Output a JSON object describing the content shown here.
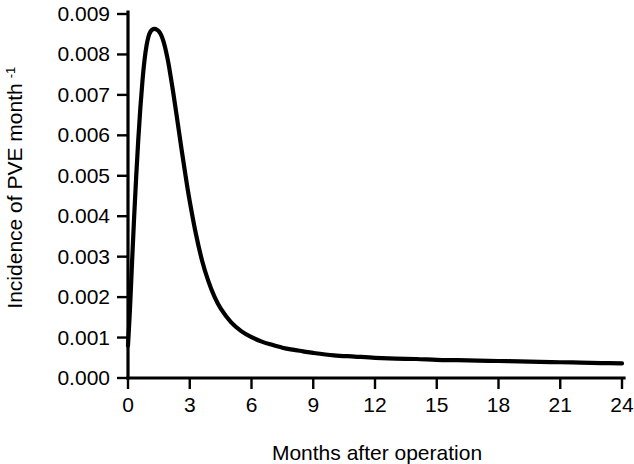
{
  "chart_data": {
    "type": "line",
    "title": "",
    "xlabel": "Months after operation",
    "ylabel": "Incidence of PVE month",
    "ylabel_superscript": "-1",
    "xlim": [
      0,
      24
    ],
    "ylim": [
      0,
      0.009
    ],
    "grid": false,
    "legend": "none",
    "x_ticks": [
      "0",
      "3",
      "6",
      "9",
      "12",
      "15",
      "18",
      "21",
      "24"
    ],
    "x_tick_values": [
      0,
      3,
      6,
      9,
      12,
      15,
      18,
      21,
      24
    ],
    "y_ticks": [
      "0.000",
      "0.001",
      "0.002",
      "0.003",
      "0.004",
      "0.005",
      "0.006",
      "0.007",
      "0.008",
      "0.009"
    ],
    "y_tick_values": [
      0.0,
      0.001,
      0.002,
      0.003,
      0.004,
      0.005,
      0.006,
      0.007,
      0.008,
      0.009
    ],
    "series": [
      {
        "name": "Incidence of PVE",
        "color": "#000000",
        "x": [
          0.0,
          0.1,
          0.2,
          0.3,
          0.4,
          0.5,
          0.6,
          0.7,
          0.8,
          0.9,
          1.0,
          1.1,
          1.2,
          1.3,
          1.4,
          1.5,
          1.6,
          1.7,
          1.8,
          1.9,
          2.0,
          2.2,
          2.4,
          2.6,
          2.8,
          3.0,
          3.3,
          3.6,
          3.9,
          4.2,
          4.5,
          5.0,
          5.5,
          6.0,
          6.5,
          7.0,
          7.5,
          8.0,
          8.5,
          9.0,
          10.0,
          11.0,
          12.0,
          13.0,
          14.0,
          15.0,
          16.0,
          17.0,
          18.0,
          19.0,
          20.0,
          21.0,
          22.0,
          23.0,
          24.0
        ],
        "y": [
          0.0008,
          0.00175,
          0.0029,
          0.004,
          0.005,
          0.0059,
          0.00668,
          0.00733,
          0.00785,
          0.00822,
          0.00845,
          0.00857,
          0.00862,
          0.00863,
          0.00861,
          0.00857,
          0.00849,
          0.00836,
          0.00818,
          0.00795,
          0.00768,
          0.00705,
          0.00636,
          0.00566,
          0.00499,
          0.00437,
          0.00356,
          0.0029,
          0.0024,
          0.00201,
          0.00172,
          0.00138,
          0.00116,
          0.00101,
          0.0009,
          0.00082,
          0.00075,
          0.0007,
          0.00066,
          0.00062,
          0.00056,
          0.00053,
          0.0005,
          0.00048,
          0.00047,
          0.00045,
          0.00044,
          0.00043,
          0.00042,
          0.00041,
          0.0004,
          0.00039,
          0.00038,
          0.00037,
          0.00036
        ]
      }
    ],
    "peak": {
      "x": 1.3,
      "y": 0.00863
    },
    "axis_color": "#000000",
    "background_color": "#ffffff"
  }
}
